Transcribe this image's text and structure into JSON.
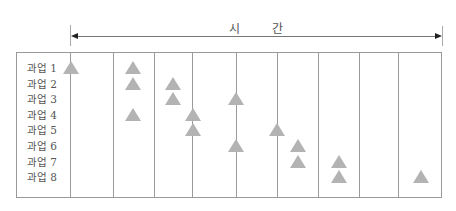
{
  "diagram": {
    "title": "시 간",
    "axis": {
      "direction": "both",
      "label": "시간"
    },
    "column_lines_x": [
      70,
      113,
      154,
      192,
      236,
      277,
      318,
      359,
      398
    ],
    "triangle_color": "#b3b3b3",
    "tasks": [
      {
        "label": "과업 1",
        "markers_x": [
          71,
          133
        ]
      },
      {
        "label": "과업 2",
        "markers_x": [
          133,
          173
        ]
      },
      {
        "label": "과업 3",
        "markers_x": [
          173,
          236
        ]
      },
      {
        "label": "과업 4",
        "markers_x": [
          133,
          193
        ]
      },
      {
        "label": "과업 5",
        "markers_x": [
          193,
          277
        ]
      },
      {
        "label": "과업 6",
        "markers_x": [
          236,
          298
        ]
      },
      {
        "label": "과업 7",
        "markers_x": [
          298,
          339
        ]
      },
      {
        "label": "과업 8",
        "markers_x": [
          339,
          421
        ]
      }
    ]
  }
}
